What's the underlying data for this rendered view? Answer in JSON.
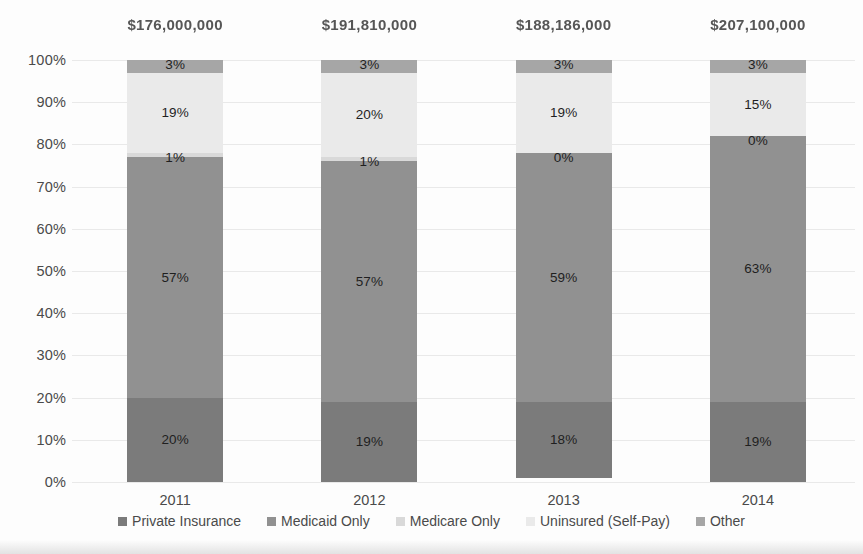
{
  "chart_data": {
    "type": "bar",
    "subtype": "stacked-100-percent",
    "title": "",
    "xlabel": "",
    "ylabel": "",
    "ylim": [
      0,
      100
    ],
    "grid": true,
    "legend_position": "bottom",
    "categories": [
      "2011",
      "2012",
      "2013",
      "2014"
    ],
    "column_totals": [
      "$176,000,000",
      "$191,810,000",
      "$188,186,000",
      "$207,100,000"
    ],
    "ytick_labels": [
      "0%",
      "10%",
      "20%",
      "30%",
      "40%",
      "50%",
      "60%",
      "70%",
      "80%",
      "90%",
      "100%"
    ],
    "ytick_values": [
      0,
      10,
      20,
      30,
      40,
      50,
      60,
      70,
      80,
      90,
      100
    ],
    "series": [
      {
        "name": "Private Insurance",
        "color": "#7b7b7b",
        "values": [
          20,
          19,
          18,
          19
        ],
        "labels": [
          "20%",
          "19%",
          "18%",
          "19%"
        ]
      },
      {
        "name": "Medicaid Only",
        "color": "#919191",
        "values": [
          57,
          57,
          59,
          63
        ],
        "labels": [
          "57%",
          "57%",
          "59%",
          "63%"
        ]
      },
      {
        "name": "Medicare Only",
        "color": "#d9d9d9",
        "values": [
          1,
          1,
          0,
          0
        ],
        "labels": [
          "1%",
          "1%",
          "0%",
          "0%"
        ]
      },
      {
        "name": "Uninsured (Self-Pay)",
        "color": "#eaeaea",
        "values": [
          19,
          20,
          19,
          15
        ],
        "labels": [
          "19%",
          "20%",
          "19%",
          "15%"
        ]
      },
      {
        "name": "Other",
        "color": "#a6a6a6",
        "values": [
          3,
          3,
          3,
          3
        ],
        "labels": [
          "3%",
          "3%",
          "3%",
          "3%"
        ]
      }
    ]
  },
  "legend": {
    "items": [
      {
        "label": "Private Insurance",
        "color": "#7b7b7b"
      },
      {
        "label": "Medicaid Only",
        "color": "#919191"
      },
      {
        "label": "Medicare Only",
        "color": "#d9d9d9"
      },
      {
        "label": "Uninsured (Self-Pay)",
        "color": "#eaeaea"
      },
      {
        "label": "Other",
        "color": "#a6a6a6"
      }
    ]
  }
}
